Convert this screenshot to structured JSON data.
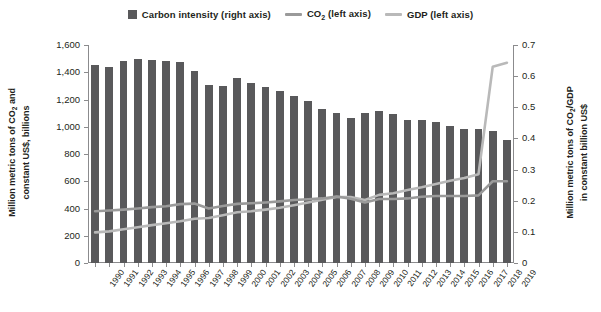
{
  "legend": {
    "items": [
      {
        "label": "Carbon intensity (right axis)",
        "marker": "bar-swatch-icon",
        "color": "#59595b"
      },
      {
        "label": "CO₂ (left axis)",
        "marker": "line-swatch-icon",
        "color": "#9a9a9a"
      },
      {
        "label": "GDP (left axis)",
        "marker": "line-swatch-icon",
        "color": "#b9b9b9"
      }
    ]
  },
  "axes": {
    "left_title": "Million metric tons of CO₂ and constant US$, billions",
    "right_title": "Million metric tons of CO₂/GDP in constant billion US$",
    "left_ticks": [
      "0",
      "200",
      "400",
      "600",
      "800",
      "1,000",
      "1,200",
      "1,400",
      "1,600"
    ],
    "right_ticks": [
      "0",
      "0.1",
      "0.2",
      "0.3",
      "0.4",
      "0.5",
      "0.6",
      "0.7"
    ]
  },
  "chart_data": {
    "type": "bar",
    "title": "",
    "xlabel": "",
    "ylabel": "Million metric tons of CO2 and constant US$, billions",
    "y2label": "Million metric tons of CO2/GDP in constant billion US$",
    "ylim": [
      0,
      1600
    ],
    "y2lim": [
      0,
      0.7
    ],
    "grid": false,
    "legend_position": "top-center",
    "categories": [
      "1990",
      "1991",
      "1992",
      "1993",
      "1994",
      "1995",
      "1996",
      "1997",
      "1998",
      "1999",
      "2000",
      "2001",
      "2002",
      "2003",
      "2004",
      "2005",
      "2006",
      "2007",
      "2008",
      "2009",
      "2010",
      "2011",
      "2012",
      "2013",
      "2014",
      "2015",
      "2016",
      "2017",
      "2018",
      "2019"
    ],
    "series": [
      {
        "name": "Carbon intensity (right axis)",
        "type": "bar",
        "axis": "right",
        "color": "#59595b",
        "values": [
          0.635,
          0.631,
          0.648,
          0.656,
          0.653,
          0.65,
          0.644,
          0.617,
          0.573,
          0.57,
          0.594,
          0.578,
          0.566,
          0.552,
          0.535,
          0.52,
          0.496,
          0.481,
          0.466,
          0.482,
          0.489,
          0.477,
          0.458,
          0.459,
          0.452,
          0.441,
          0.431,
          0.43,
          0.425,
          0.396
        ]
      },
      {
        "name": "CO₂ (left axis)",
        "type": "line",
        "axis": "left",
        "color": "#9a9a9a",
        "values": [
          380,
          385,
          392,
          400,
          410,
          416,
          432,
          436,
          400,
          418,
          434,
          438,
          444,
          452,
          462,
          468,
          474,
          488,
          472,
          444,
          470,
          470,
          474,
          486,
          492,
          492,
          492,
          496,
          600,
          600
        ]
      },
      {
        "name": "GDP (left axis)",
        "type": "line",
        "axis": "left",
        "color": "#b9b9b9",
        "values": [
          225,
          232,
          248,
          262,
          278,
          292,
          306,
          325,
          330,
          350,
          372,
          380,
          392,
          406,
          424,
          444,
          464,
          484,
          484,
          462,
          500,
          512,
          536,
          556,
          580,
          604,
          624,
          652,
          1440,
          1470
        ]
      }
    ]
  }
}
